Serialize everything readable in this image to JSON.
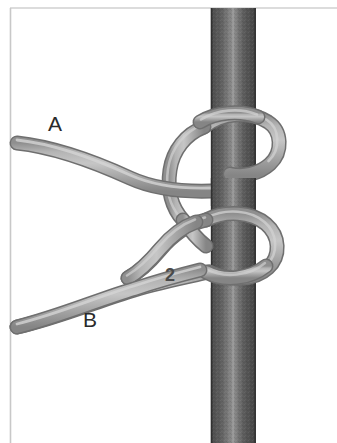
{
  "figure": {
    "background_color": "#ffffff",
    "border_color": "#cfcfcf"
  },
  "pole": {
    "name": "vertical-pole",
    "fill_dark": "#4e4e4e",
    "fill_mid": "#5c5c5c",
    "fill_light": "#8d8d8d",
    "edge_color": "#3a3a3a",
    "left_x": 211,
    "right_x": 256,
    "top_y": 8,
    "bottom_y": 443
  },
  "rope": {
    "name": "rope",
    "fill": "#a9a9a9",
    "fill_light": "#c2c2c2",
    "edge_color": "#777777",
    "width_px": 13
  },
  "labels": {
    "a": "A",
    "b": "B",
    "step": "2"
  },
  "annotations": [
    {
      "id": "label-a",
      "text": "A",
      "x": 57,
      "y": 126,
      "bold": false
    },
    {
      "id": "label-b",
      "text": "B",
      "x": 92,
      "y": 322,
      "bold": false
    },
    {
      "id": "label-step-2",
      "text": "2",
      "x": 173,
      "y": 277,
      "bold": true
    }
  ]
}
